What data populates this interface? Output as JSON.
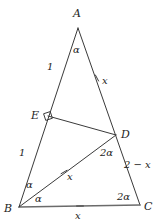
{
  "figure": {
    "kind": "euclidean-geometry-diagram",
    "background_color": "#ffffff",
    "stroke_color": "#3a3a3a",
    "base_stroke_color": "#6b6b6b",
    "text_color": "#1d1d1d",
    "width": 157,
    "height": 222
  },
  "vertices": [
    {
      "id": "A",
      "label": "A",
      "x": 78,
      "y": 28,
      "label_x": 73,
      "label_y": 8
    },
    {
      "id": "B",
      "label": "B",
      "x": 19,
      "y": 207,
      "label_x": 4,
      "label_y": 203
    },
    {
      "id": "C",
      "label": "C",
      "x": 140,
      "y": 205,
      "label_x": 144,
      "label_y": 201
    },
    {
      "id": "D",
      "label": "D",
      "x": 116,
      "y": 135,
      "label_x": 121,
      "label_y": 129
    },
    {
      "id": "E",
      "label": "E",
      "x": 48,
      "y": 116,
      "label_x": 31,
      "label_y": 110
    }
  ],
  "segments": [
    {
      "id": "AB",
      "from": "A",
      "to": "B",
      "role": "triangle-side"
    },
    {
      "id": "AC",
      "from": "A",
      "to": "C",
      "role": "triangle-side"
    },
    {
      "id": "BC",
      "from": "B",
      "to": "C",
      "role": "triangle-base"
    },
    {
      "id": "BD",
      "from": "B",
      "to": "D",
      "role": "cevian"
    },
    {
      "id": "ED",
      "from": "E",
      "to": "D",
      "role": "perpendicular-segment"
    }
  ],
  "side_labels": [
    {
      "id": "AE-length",
      "on": "AB",
      "text": "1",
      "x": 47,
      "y": 62
    },
    {
      "id": "AD-length",
      "on": "AC",
      "text": "x",
      "x": 102,
      "y": 76
    },
    {
      "id": "EB-length",
      "on": "AB",
      "text": "1",
      "x": 19,
      "y": 148
    },
    {
      "id": "DC-length",
      "on": "AC",
      "text": "2 − x",
      "x": 124,
      "y": 160
    },
    {
      "id": "BD-length",
      "on": "BD",
      "text": "x",
      "x": 67,
      "y": 172
    },
    {
      "id": "BC-length",
      "on": "BC",
      "text": "x",
      "x": 75,
      "y": 211
    }
  ],
  "tick_marks": [
    {
      "id": "tick-AD",
      "on": "AC",
      "x": 97,
      "y": 78,
      "angle": 62
    },
    {
      "id": "tick-BD",
      "on": "BD",
      "x": 64,
      "y": 172,
      "angle": -30
    },
    {
      "id": "tick-BC",
      "on": "BC",
      "x": 80,
      "y": 206,
      "angle": 0
    }
  ],
  "angle_labels": [
    {
      "id": "angle-A",
      "at": "A",
      "text": "α",
      "x": 73,
      "y": 45
    },
    {
      "id": "angle-DBC",
      "at": "B",
      "text": "α",
      "x": 35,
      "y": 194
    },
    {
      "id": "angle-ABD",
      "at": "B",
      "text": "α",
      "x": 26,
      "y": 180
    },
    {
      "id": "angle-BDC",
      "at": "D",
      "text": "2α",
      "x": 100,
      "y": 148
    },
    {
      "id": "angle-C",
      "at": "C",
      "text": "2α",
      "x": 117,
      "y": 192
    }
  ],
  "right_angle_marker": {
    "id": "right-angle-E",
    "at": "E",
    "x": 48,
    "y": 116,
    "size": 7,
    "rotation": -18,
    "meaning": "ED perpendicular to AB"
  }
}
